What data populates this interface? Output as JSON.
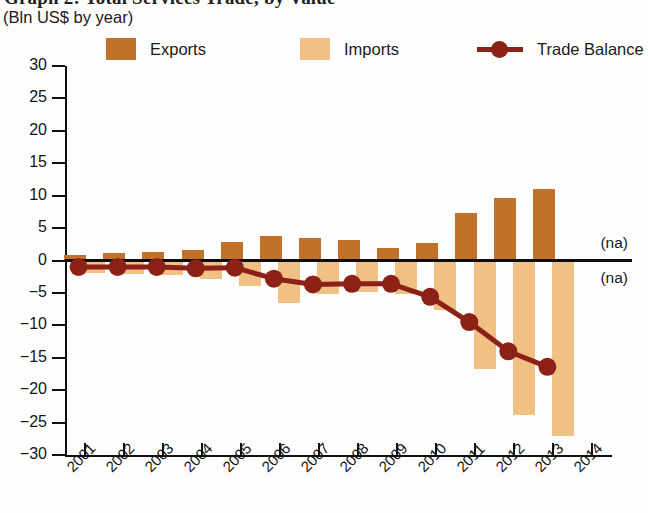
{
  "title": {
    "main": "Graph 2: Total Services Trade, by Value",
    "subtitle": "(Bln US$ by year)"
  },
  "legend": {
    "position": "top",
    "items": [
      {
        "label": "Exports",
        "color": "#c2712a",
        "marker": "square",
        "name": "legend-exports"
      },
      {
        "label": "Imports",
        "color": "#f0c183",
        "marker": "square",
        "name": "legend-imports"
      },
      {
        "label": "Trade Balance",
        "color": "#8b2117",
        "marker": "line-dot",
        "name": "legend-trade-balance"
      }
    ]
  },
  "annotations": [
    {
      "text": "(na)",
      "year": "2014",
      "side": "above-zero"
    },
    {
      "text": "(na)",
      "year": "2014",
      "side": "below-zero"
    }
  ],
  "chart_data": {
    "type": "bar",
    "title": "Graph 2: Total Services Trade, by Value",
    "subtitle": "(Bln US$ by year)",
    "xlabel": "",
    "ylabel": "Bln US$",
    "ylim": [
      -30,
      30
    ],
    "ytick_step": 5,
    "yticks": [
      30,
      25,
      20,
      15,
      10,
      5,
      0,
      -5,
      -10,
      -15,
      -20,
      -25,
      -30
    ],
    "ytick_labels": [
      "30",
      "25",
      "20",
      "15",
      "10",
      "5",
      "0",
      "−5",
      "−10",
      "−15",
      "−20",
      "−25",
      "−30"
    ],
    "grid": false,
    "categories": [
      "2001",
      "2002",
      "2003",
      "2004",
      "2005",
      "2006",
      "2007",
      "2008",
      "2009",
      "2010",
      "2011",
      "2012",
      "2013",
      "2014"
    ],
    "series": [
      {
        "name": "Exports",
        "type": "bar",
        "color": "#c2712a",
        "values": [
          0.9,
          1.1,
          1.3,
          1.6,
          2.8,
          3.8,
          3.4,
          3.2,
          1.9,
          2.7,
          7.3,
          9.7,
          11.1,
          null
        ]
      },
      {
        "name": "Imports",
        "type": "bar",
        "color": "#f0c183",
        "values": [
          -1.9,
          -2.1,
          -2.3,
          -2.8,
          -3.9,
          -6.6,
          -5.1,
          -4.9,
          -5.1,
          -7.6,
          -16.8,
          -23.8,
          -27.1,
          null
        ]
      },
      {
        "name": "Trade Balance",
        "type": "line",
        "color": "#8b2117",
        "values": [
          -1.0,
          -1.0,
          -1.0,
          -1.2,
          -1.1,
          -2.8,
          -3.7,
          -3.6,
          -3.6,
          -5.6,
          -9.5,
          -14.0,
          -16.4,
          null
        ]
      }
    ]
  }
}
